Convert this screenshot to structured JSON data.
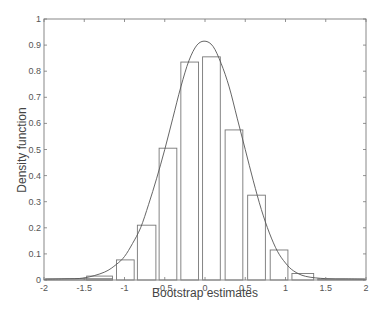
{
  "chart_data": {
    "type": "bar",
    "subtype": "histogram-with-density-curve",
    "title": "",
    "xlabel": "Bootstrap estimates",
    "ylabel": "Density function",
    "xlim": [
      -2,
      2
    ],
    "ylim": [
      0,
      1
    ],
    "xticks": [
      -2,
      -1.5,
      -1,
      -0.5,
      0,
      0.5,
      1,
      1.5,
      2
    ],
    "xtick_labels": [
      "-2",
      "-1.5",
      "-1",
      "-0.5",
      "0",
      "0.5",
      "1",
      "1.5",
      "2"
    ],
    "yticks": [
      0,
      0.1,
      0.2,
      0.3,
      0.4,
      0.5,
      0.6,
      0.7,
      0.8,
      0.9,
      1
    ],
    "ytick_labels": [
      "0",
      "0.1",
      "0.2",
      "0.3",
      "0.4",
      "0.5",
      "0.6",
      "0.7",
      "0.8",
      "0.9",
      "1"
    ],
    "grid": false,
    "legend": null,
    "bars": [
      {
        "x0": -1.98,
        "x1": -1.15,
        "height": 0.005
      },
      {
        "x0": -1.47,
        "x1": -1.15,
        "height": 0.015
      },
      {
        "x0": -1.1,
        "x1": -0.88,
        "height": 0.077
      },
      {
        "x0": -0.84,
        "x1": -0.61,
        "height": 0.21
      },
      {
        "x0": -0.57,
        "x1": -0.35,
        "height": 0.505
      },
      {
        "x0": -0.3,
        "x1": -0.08,
        "height": 0.835
      },
      {
        "x0": -0.03,
        "x1": 0.19,
        "height": 0.855
      },
      {
        "x0": 0.25,
        "x1": 0.47,
        "height": 0.575
      },
      {
        "x0": 0.53,
        "x1": 0.75,
        "height": 0.325
      },
      {
        "x0": 0.81,
        "x1": 1.03,
        "height": 0.115
      },
      {
        "x0": 1.08,
        "x1": 1.35,
        "height": 0.025
      },
      {
        "x0": 1.4,
        "x1": 1.98,
        "height": 0.004
      }
    ],
    "curve": {
      "name": "Density estimate",
      "x": [
        -2,
        -1.75,
        -1.5,
        -1.25,
        -1.1,
        -1.0,
        -0.9,
        -0.8,
        -0.7,
        -0.6,
        -0.5,
        -0.4,
        -0.3,
        -0.2,
        -0.1,
        0,
        0.1,
        0.2,
        0.3,
        0.4,
        0.5,
        0.6,
        0.7,
        0.8,
        0.9,
        1.0,
        1.1,
        1.25,
        1.5,
        1.75,
        2
      ],
      "y": [
        0.002,
        0.004,
        0.008,
        0.03,
        0.06,
        0.09,
        0.14,
        0.2,
        0.29,
        0.39,
        0.5,
        0.62,
        0.74,
        0.84,
        0.9,
        0.915,
        0.895,
        0.83,
        0.74,
        0.62,
        0.5,
        0.38,
        0.27,
        0.18,
        0.11,
        0.065,
        0.035,
        0.014,
        0.005,
        0.004,
        0.003
      ]
    }
  },
  "layout": {
    "plot_left": 44,
    "plot_right": 366,
    "plot_top": 19,
    "plot_bottom": 280,
    "colors": {
      "axis": "#777777",
      "bars": "#777777",
      "curve": "#555555",
      "text": "#555555"
    }
  }
}
